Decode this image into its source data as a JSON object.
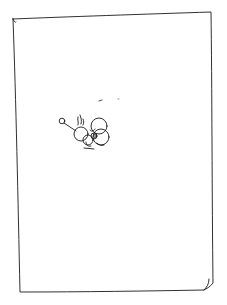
{
  "sketch": {
    "description": "Hand-drawn pencil sketch on white paper: a rectangular page border with a small doodle of clustered circles (a creature with a antenna-like stalk ending in a small circle) left of center",
    "stroke_color": "#1a1a1a",
    "background_color": "#ffffff"
  }
}
